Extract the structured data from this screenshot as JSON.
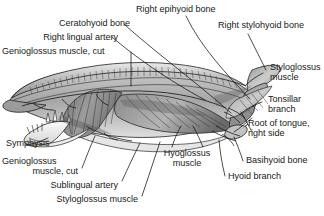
{
  "figure": {
    "background_color": "#ffffff",
    "ink_color": "#1a1a1a",
    "leader_line_color": "#111111"
  },
  "labels": {
    "ceratohyoid_bone": "Ceratohyoid bone",
    "right_lingual_artery": "Right lingual artery",
    "genioglossus_muscle_cut_top": "Genioglossus muscle, cut",
    "right_epihyoid_bone": "Right epihyoid bone",
    "right_stylohyoid_bone": "Right stylohyoid bone",
    "styloglossus_muscle_right_l1": "Styloglossus",
    "styloglossus_muscle_right_l2": "muscle",
    "tonsillar_branch_l1": "Tonsillar",
    "tonsillar_branch_l2": "branch",
    "root_of_tongue_l1": "Root of tongue,",
    "root_of_tongue_l2": "right side",
    "basihyoid_bone": "Basihyoid bone",
    "hyoid_branch": "Hyoid branch",
    "hyoglossus_muscle_l1": "Hyoglossus",
    "hyoglossus_muscle_l2": "muscle",
    "symphysis": "Symphysis",
    "genioglossus_muscle_cut_b1": "Genioglossus",
    "genioglossus_muscle_cut_b2": "muscle, cut",
    "sublingual_artery": "Sublingual artery",
    "styloglossus_muscle_bottom": "Styloglossus muscle"
  }
}
